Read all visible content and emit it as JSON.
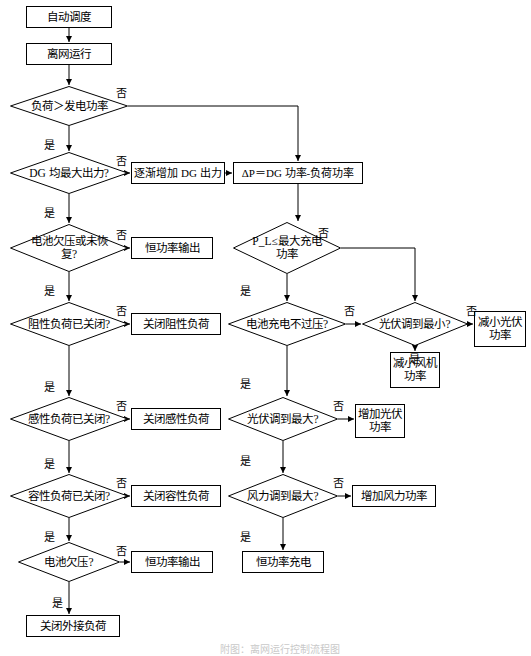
{
  "diagram": {
    "title": "离网运行控制流程图",
    "caption": "附图：离网运行控制流程图",
    "font_color": "#000000",
    "line_color": "#000000",
    "background": "#ffffff",
    "nodes": [
      {
        "id": "n1",
        "shape": "rect",
        "label": "自动调度",
        "x": 26,
        "y": 6,
        "w": 86,
        "h": 22,
        "fs": 11.5
      },
      {
        "id": "n2",
        "shape": "rect",
        "label": "离网运行",
        "x": 26,
        "y": 43,
        "w": 86,
        "h": 22,
        "fs": 11.5
      },
      {
        "id": "n3",
        "shape": "diamond",
        "label": "负荷＞发电功率",
        "x": 10,
        "y": 86,
        "w": 118,
        "h": 40,
        "fs": 11.5
      },
      {
        "id": "n4",
        "shape": "diamond",
        "label": "DG 均最大出力?",
        "x": 10,
        "y": 152,
        "w": 118,
        "h": 42,
        "fs": 11.5
      },
      {
        "id": "n5",
        "shape": "rect",
        "label": "逐渐增加 DG 出力",
        "x": 131,
        "y": 162,
        "w": 94,
        "h": 22,
        "fs": 11
      },
      {
        "id": "n6",
        "shape": "rect",
        "label": "ΔP＝DG 功率-负荷功率",
        "x": 233,
        "y": 162,
        "w": 130,
        "h": 22,
        "fs": 11
      },
      {
        "id": "n7",
        "shape": "diamond",
        "label": "电池欠压或未恢复?",
        "x": 10,
        "y": 224,
        "w": 118,
        "h": 48,
        "fs": 11.5
      },
      {
        "id": "n8",
        "shape": "rect",
        "label": "恒功率输出",
        "x": 131,
        "y": 237,
        "w": 82,
        "h": 22,
        "fs": 11.5
      },
      {
        "id": "n9",
        "shape": "diamond",
        "label": "P_L≤最大充电功率",
        "x": 233,
        "y": 222,
        "w": 108,
        "h": 52,
        "fs": 11.5
      },
      {
        "id": "n10",
        "shape": "diamond",
        "label": "阻性负荷已关闭?",
        "x": 10,
        "y": 302,
        "w": 118,
        "h": 44,
        "fs": 11.5
      },
      {
        "id": "n11",
        "shape": "rect",
        "label": "关闭阻性负荷",
        "x": 131,
        "y": 313,
        "w": 90,
        "h": 22,
        "fs": 11.5
      },
      {
        "id": "n12",
        "shape": "diamond",
        "label": "电池充电不过压?",
        "x": 228,
        "y": 302,
        "w": 118,
        "h": 44,
        "fs": 11.5
      },
      {
        "id": "n13",
        "shape": "diamond",
        "label": "光伏调到最小?",
        "x": 362,
        "y": 302,
        "w": 106,
        "h": 44,
        "fs": 11.5
      },
      {
        "id": "n14",
        "shape": "rect",
        "label": "减小光伏功率",
        "x": 474,
        "y": 311,
        "w": 52,
        "h": 36,
        "fs": 11.5
      },
      {
        "id": "n15",
        "shape": "rect",
        "label": "减小风机功率",
        "x": 390,
        "y": 352,
        "w": 50,
        "h": 36,
        "fs": 11.5
      },
      {
        "id": "n16",
        "shape": "diamond",
        "label": "感性负荷已关闭?",
        "x": 10,
        "y": 397,
        "w": 118,
        "h": 44,
        "fs": 11.5
      },
      {
        "id": "n17",
        "shape": "rect",
        "label": "关闭感性负荷",
        "x": 131,
        "y": 408,
        "w": 90,
        "h": 22,
        "fs": 11.5
      },
      {
        "id": "n18",
        "shape": "diamond",
        "label": "光伏调到最大?",
        "x": 228,
        "y": 397,
        "w": 110,
        "h": 44,
        "fs": 11.5
      },
      {
        "id": "n19",
        "shape": "rect",
        "label": "增加光伏功率",
        "x": 355,
        "y": 404,
        "w": 50,
        "h": 34,
        "fs": 11.5
      },
      {
        "id": "n20",
        "shape": "diamond",
        "label": "容性负荷已关闭?",
        "x": 10,
        "y": 474,
        "w": 118,
        "h": 44,
        "fs": 11.5
      },
      {
        "id": "n21",
        "shape": "rect",
        "label": "关闭容性负荷",
        "x": 131,
        "y": 485,
        "w": 90,
        "h": 22,
        "fs": 11.5
      },
      {
        "id": "n22",
        "shape": "diamond",
        "label": "风力调到最大?",
        "x": 228,
        "y": 474,
        "w": 110,
        "h": 44,
        "fs": 11.5
      },
      {
        "id": "n23",
        "shape": "rect",
        "label": "增加风力功率",
        "x": 352,
        "y": 485,
        "w": 84,
        "h": 22,
        "fs": 11.5
      },
      {
        "id": "n24",
        "shape": "diamond",
        "label": "电池欠压?",
        "x": 18,
        "y": 542,
        "w": 102,
        "h": 40,
        "fs": 11.5
      },
      {
        "id": "n25",
        "shape": "rect",
        "label": "恒功率输出",
        "x": 131,
        "y": 551,
        "w": 82,
        "h": 22,
        "fs": 11.5
      },
      {
        "id": "n26",
        "shape": "rect",
        "label": "恒功率充电",
        "x": 242,
        "y": 551,
        "w": 82,
        "h": 22,
        "fs": 11.5
      },
      {
        "id": "n27",
        "shape": "rect",
        "label": "关闭外接负荷",
        "x": 26,
        "y": 615,
        "w": 94,
        "h": 22,
        "fs": 11.5
      }
    ],
    "edge_labels": [
      {
        "id": "e1",
        "text": "否",
        "x": 116,
        "y": 84
      },
      {
        "id": "e2",
        "text": "是",
        "x": 44,
        "y": 136
      },
      {
        "id": "e3",
        "text": "否",
        "x": 116,
        "y": 152
      },
      {
        "id": "e4",
        "text": "是",
        "x": 44,
        "y": 204
      },
      {
        "id": "e5",
        "text": "否",
        "x": 116,
        "y": 226
      },
      {
        "id": "e6",
        "text": "否",
        "x": 318,
        "y": 224
      },
      {
        "id": "e7",
        "text": "是",
        "x": 44,
        "y": 282
      },
      {
        "id": "e8",
        "text": "是",
        "x": 240,
        "y": 282
      },
      {
        "id": "e9",
        "text": "否",
        "x": 116,
        "y": 302
      },
      {
        "id": "e10",
        "text": "否",
        "x": 344,
        "y": 302
      },
      {
        "id": "e11",
        "text": "否",
        "x": 466,
        "y": 302
      },
      {
        "id": "e12",
        "text": "是",
        "x": 409,
        "y": 350
      },
      {
        "id": "e13",
        "text": "是",
        "x": 44,
        "y": 378
      },
      {
        "id": "e14",
        "text": "是",
        "x": 240,
        "y": 375
      },
      {
        "id": "e15",
        "text": "否",
        "x": 116,
        "y": 397
      },
      {
        "id": "e16",
        "text": "否",
        "x": 333,
        "y": 397
      },
      {
        "id": "e17",
        "text": "是",
        "x": 44,
        "y": 455
      },
      {
        "id": "e18",
        "text": "是",
        "x": 240,
        "y": 452
      },
      {
        "id": "e19",
        "text": "否",
        "x": 116,
        "y": 474
      },
      {
        "id": "e20",
        "text": "否",
        "x": 333,
        "y": 474
      },
      {
        "id": "e21",
        "text": "是",
        "x": 44,
        "y": 528
      },
      {
        "id": "e22",
        "text": "是",
        "x": 240,
        "y": 528
      },
      {
        "id": "e23",
        "text": "否",
        "x": 116,
        "y": 542
      },
      {
        "id": "e24",
        "text": "是",
        "x": 52,
        "y": 594
      }
    ]
  }
}
